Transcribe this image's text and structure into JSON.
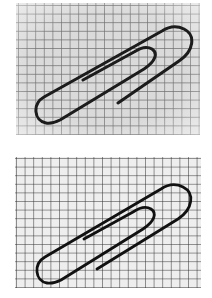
{
  "figures": [
    {
      "id": "top",
      "subject": "paperclip on grid paper",
      "style": "blurred grid, grey background",
      "background_color": "#d8d8d8",
      "grid_color": "#6a6a6a",
      "grid_spacing_px": 8.6,
      "clip_color": "#1a1a1a"
    },
    {
      "id": "bottom",
      "subject": "paperclip on grid paper",
      "style": "sharp grid, light background",
      "background_color": "#ececec",
      "grid_color": "#2a2a2a",
      "grid_spacing_px": 8.6,
      "clip_color": "#111111"
    }
  ]
}
